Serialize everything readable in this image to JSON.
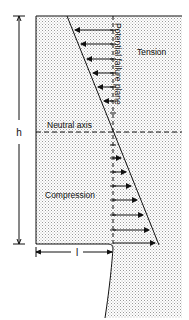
{
  "diagram": {
    "type": "stress-distribution",
    "labels": {
      "tension": "Tension",
      "compression": "Compression",
      "neutral_axis": "Neutral axis",
      "failure_plane": "Potential failure plane",
      "height": "h",
      "length": "l"
    },
    "colors": {
      "ink": "#111111",
      "stipple": "#9a9a9a",
      "background": "#ffffff"
    },
    "tension_arrows": 6,
    "compression_arrows": 7
  }
}
